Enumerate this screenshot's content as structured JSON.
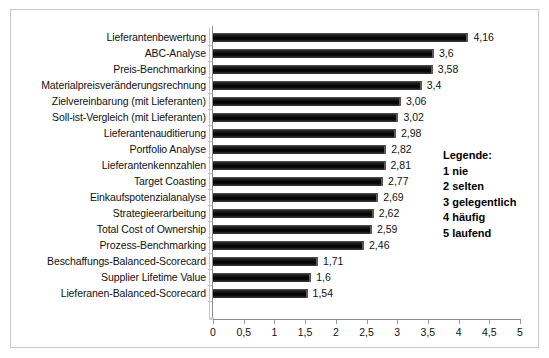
{
  "chart_data": {
    "type": "bar",
    "orientation": "horizontal",
    "title": "",
    "xlabel": "",
    "ylabel": "",
    "xlim": [
      0,
      5
    ],
    "xticks": [
      "0",
      "0,5",
      "1",
      "1,5",
      "2",
      "2,5",
      "3",
      "3,5",
      "4",
      "4,5",
      "5"
    ],
    "xtick_values": [
      0,
      0.5,
      1,
      1.5,
      2,
      2.5,
      3,
      3.5,
      4,
      4.5,
      5
    ],
    "grid": false,
    "decimal_separator": ",",
    "categories": [
      "Lieferantenbewertung",
      "ABC-Analyse",
      "Preis-Benchmarking",
      "Materialpreisveränderungsrechnung",
      "Zielvereinbarung (mit Lieferanten)",
      "Soll-ist-Vergleich (mit Lieferanten)",
      "Lieferantenauditierung",
      "Portfolio Analyse",
      "Lieferantenkennzahlen",
      "Target Coasting",
      "Einkaufspotenzialanalyse",
      "Strategieerarbeitung",
      "Total Cost of Ownership",
      "Prozess-Benchmarking",
      "Beschaffungs-Balanced-Scorecard",
      "Supplier Lifetime Value",
      "Lieferanen-Balanced-Scorecard"
    ],
    "values": [
      4.16,
      3.6,
      3.58,
      3.4,
      3.06,
      3.02,
      2.98,
      2.82,
      2.81,
      2.77,
      2.69,
      2.62,
      2.59,
      2.46,
      1.71,
      1.6,
      1.54
    ],
    "value_labels": [
      "4,16",
      "3,6",
      "3,58",
      "3,4",
      "3,06",
      "3,02",
      "2,98",
      "2,82",
      "2,81",
      "2,77",
      "2,69",
      "2,62",
      "2,59",
      "2,46",
      "1,71",
      "1,6",
      "1,54"
    ],
    "bar_color": "#000000",
    "legend_position": "right-inside"
  },
  "legend": {
    "title": "Legende:",
    "items": [
      "1 nie",
      "2 selten",
      "3 gelegentlich",
      "4 häufig",
      "5 laufend"
    ]
  }
}
